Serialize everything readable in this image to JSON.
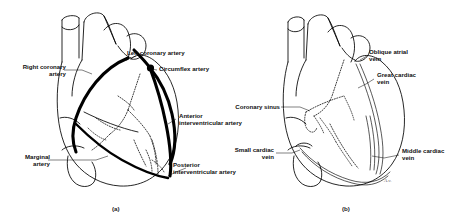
{
  "figure": {
    "background": "#ffffff",
    "ink": "#000000",
    "panels": [
      {
        "id": "a",
        "caption": "(a)",
        "view": "anterior view of heart showing coronary arteries",
        "labels": [
          {
            "name": "right-coronary-artery",
            "text": "Right coronary\nartery",
            "align": "right"
          },
          {
            "name": "marginal-artery",
            "text": "Marginal\nartery",
            "align": "right"
          },
          {
            "name": "left-coronary-artery",
            "text": "Left coronary artery",
            "align": "left"
          },
          {
            "name": "circumflex-artery",
            "text": "Circumflex artery",
            "align": "left"
          },
          {
            "name": "anterior-interventricular-artery",
            "text": "Anterior\ninterventricular artery",
            "align": "left"
          },
          {
            "name": "posterior-interventricular-artery",
            "text": "Posterior\ninterventricular artery",
            "align": "left"
          }
        ]
      },
      {
        "id": "b",
        "caption": "(b)",
        "view": "posterior view of heart showing cardiac veins",
        "labels": [
          {
            "name": "coronary-sinus",
            "text": "Coronary sinus",
            "align": "right"
          },
          {
            "name": "small-cardiac-vein",
            "text": "Small cardiac\nvein",
            "align": "right"
          },
          {
            "name": "oblique-atrial-vein",
            "text": "Oblique atrial\nvein",
            "align": "left"
          },
          {
            "name": "great-cardiac-vein",
            "text": "Great cardiac\nvein",
            "align": "left"
          },
          {
            "name": "middle-cardiac-vein",
            "text": "Middle cardiac\nvein",
            "align": "left"
          }
        ]
      }
    ],
    "artist_signature": "A.v."
  }
}
